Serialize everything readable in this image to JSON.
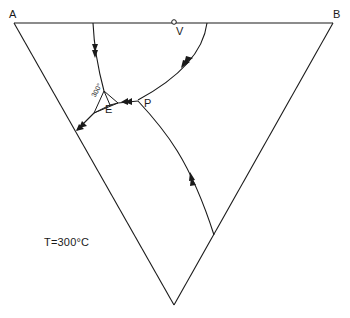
{
  "diagram": {
    "type": "ternary-phase-diagram",
    "vertices": {
      "a": "A",
      "b": "B"
    },
    "points": {
      "v": "V",
      "e": "E",
      "p": "P"
    },
    "isotherm_label": "300°",
    "temperature_label": "T=300°C",
    "colors": {
      "line": "#1a1a1a",
      "background": "#ffffff"
    }
  }
}
